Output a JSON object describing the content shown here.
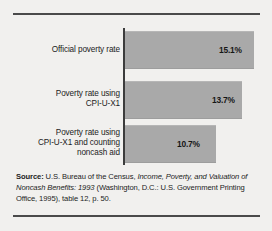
{
  "chart_data": {
    "type": "bar",
    "orientation": "horizontal",
    "title": "",
    "xlabel": "",
    "ylabel": "",
    "categories": [
      "Official poverty rate",
      "Poverty rate using\nCPI-U-X1",
      "Poverty rate using\nCPI-U-X1 and counting\nnoncash aid"
    ],
    "category_lines": [
      [
        "Official poverty rate"
      ],
      [
        "Poverty rate using",
        "CPI-U-X1"
      ],
      [
        "Poverty rate using",
        "CPI-U-X1 and counting",
        "noncash aid"
      ]
    ],
    "values": [
      15.1,
      13.7,
      10.7
    ],
    "value_labels": [
      "15.1%",
      "13.7%",
      "10.7%"
    ],
    "xlim": [
      0,
      15.1
    ],
    "grid": false,
    "legend": null,
    "bar_color": "#a9a9a9",
    "axis_color": "#3c3c3c",
    "background_color": "#f1f0ee"
  },
  "source_note": {
    "label": "Source:",
    "text_part_1": " U.S. Bureau of the Census, ",
    "italic_title": "Income, Poverty, and Valuation of Noncash Benefits: 1993",
    "text_part_2": " (Washington, D.C.: U.S. Government Printing Office, 1995), table 12, p. 50."
  }
}
